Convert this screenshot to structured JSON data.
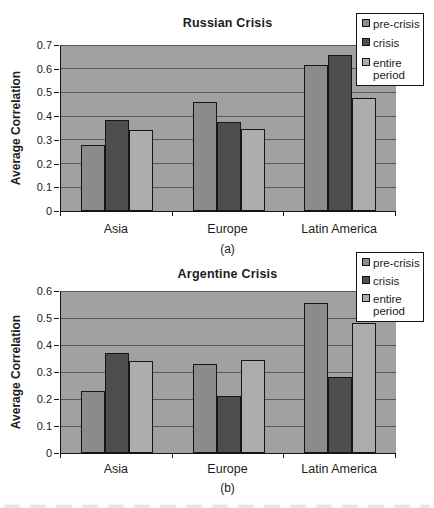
{
  "style_colors": {
    "axis": "#141414",
    "grid": "#5a5a5a",
    "text": "#1c1c1c",
    "legend_bg": "#ffffff",
    "legend_border": "#141414"
  },
  "chart_data": [
    {
      "type": "bar",
      "title": "Russian Crisis",
      "panel_label": "(a)",
      "ylabel": "Average Correlation",
      "categories": [
        "Asia",
        "Europe",
        "Latin America"
      ],
      "series": [
        {
          "name": "pre-crisis",
          "color": "#8b8b8b",
          "values": [
            0.28,
            0.46,
            0.615
          ]
        },
        {
          "name": "crisis",
          "color": "#4e4e4e",
          "values": [
            0.385,
            0.375,
            0.66
          ]
        },
        {
          "name": "entire period",
          "color": "#adadad",
          "values": [
            0.34,
            0.345,
            0.475
          ]
        }
      ],
      "ylim": [
        0,
        0.7
      ],
      "ytick_step": 0.1,
      "grid": true,
      "legend_position": "top-right",
      "plot_bg": "#a1a1a1"
    },
    {
      "type": "bar",
      "title": "Argentine Crisis",
      "panel_label": "(b)",
      "ylabel": "Average Correlation",
      "categories": [
        "Asia",
        "Europe",
        "Latin America"
      ],
      "series": [
        {
          "name": "pre-crisis",
          "color": "#8b8b8b",
          "values": [
            0.23,
            0.33,
            0.555
          ]
        },
        {
          "name": "crisis",
          "color": "#4e4e4e",
          "values": [
            0.37,
            0.21,
            0.28
          ]
        },
        {
          "name": "entire period",
          "color": "#adadad",
          "values": [
            0.34,
            0.345,
            0.48
          ]
        }
      ],
      "ylim": [
        0,
        0.6
      ],
      "ytick_step": 0.1,
      "grid": true,
      "legend_position": "top-right",
      "plot_bg": "#a1a1a1"
    }
  ]
}
